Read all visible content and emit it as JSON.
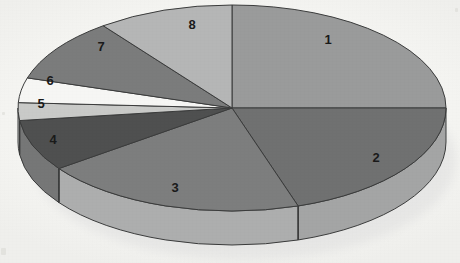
{
  "chart_data": {
    "type": "pie",
    "title": "",
    "subtitle": "",
    "xlabel": "",
    "ylabel": "",
    "three_d": true,
    "legend_position": "none",
    "labels_on_slices": true,
    "start_angle_deg": 0,
    "direction": "clockwise",
    "categories": [
      "1",
      "2",
      "3",
      "4",
      "5",
      "6",
      "7",
      "8"
    ],
    "values": [
      25,
      20,
      20,
      8,
      3,
      4,
      10,
      10
    ],
    "unit": "%",
    "angles_deg": [
      90,
      72,
      72,
      29,
      10,
      14,
      36,
      37
    ],
    "slices": [
      {
        "label": "1",
        "value": 25,
        "angle_deg": 90,
        "color": "#9a9b9b",
        "side_color": "#adaeae",
        "label_x": 328,
        "label_y": 39
      },
      {
        "label": "2",
        "value": 20,
        "angle_deg": 72,
        "color": "#707171",
        "side_color": "#a4a5a5",
        "label_x": 376,
        "label_y": 157
      },
      {
        "label": "3",
        "value": 20,
        "angle_deg": 72,
        "color": "#7d7e7e",
        "side_color": "#adaeae",
        "label_x": 175,
        "label_y": 187
      },
      {
        "label": "4",
        "value": 8,
        "angle_deg": 29,
        "color": "#4f5050",
        "side_color": "#767777",
        "label_x": 53,
        "label_y": 139
      },
      {
        "label": "5",
        "value": 3,
        "angle_deg": 10,
        "color": "#c9cac8",
        "side_color": "#b7b8b6",
        "label_x": 41,
        "label_y": 103
      },
      {
        "label": "6",
        "value": 4,
        "angle_deg": 14,
        "color": "#f6f6f4",
        "side_color": "#e0e0dd",
        "label_x": 50,
        "label_y": 80
      },
      {
        "label": "7",
        "value": 10,
        "angle_deg": 36,
        "color": "#7b7c7c",
        "side_color": "#8d8e8e",
        "label_x": 101,
        "label_y": 46
      },
      {
        "label": "8",
        "value": 10,
        "angle_deg": 37,
        "color": "#b5b6b6",
        "side_color": "#c0c1c1",
        "label_x": 192,
        "label_y": 24
      }
    ],
    "geometry": {
      "center_x": 232,
      "center_y": 108,
      "radius_x": 214,
      "radius_y": 103,
      "depth": 34
    },
    "colors": {
      "background": "#f6f6f4",
      "outline": "#3b3c3c",
      "label_text": "#1a1a1a",
      "shadow": "#e2e2df"
    }
  }
}
